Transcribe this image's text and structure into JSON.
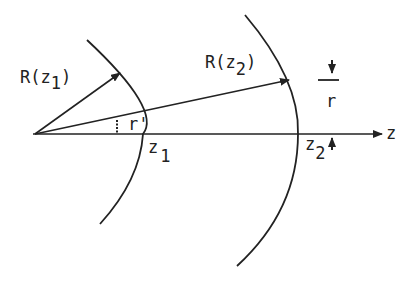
{
  "diagram": {
    "labels": {
      "R1": "R(z",
      "R1_sub": "1",
      "R1_close": ")",
      "R2": "R(z",
      "R2_sub": "2",
      "R2_close": ")",
      "r_prime": "r'",
      "z1": "z",
      "z1_sub": "1",
      "z2": "z",
      "z2_sub": "2",
      "r": "r",
      "z_axis": "z"
    },
    "colors": {
      "ink": "#222222",
      "background": "#ffffff"
    }
  }
}
